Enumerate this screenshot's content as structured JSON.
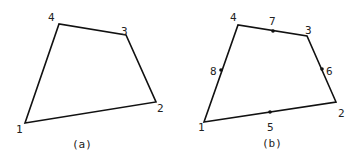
{
  "figures": [
    {
      "id": "a",
      "caption": "(a)",
      "corner_labels": [
        "1",
        "2",
        "3",
        "4"
      ],
      "midside_labels": []
    },
    {
      "id": "b",
      "caption": "(b)",
      "corner_labels": [
        "1",
        "2",
        "3",
        "4"
      ],
      "midside_labels": [
        "5",
        "6",
        "7",
        "8"
      ]
    }
  ]
}
